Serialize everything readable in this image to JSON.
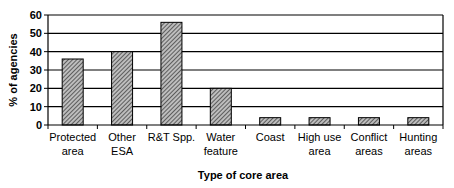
{
  "chart_data": {
    "type": "bar",
    "title": "",
    "xlabel": "Type of core area",
    "ylabel": "% of agencies",
    "categories": [
      [
        "Protected",
        "area"
      ],
      [
        "Other",
        "ESA"
      ],
      [
        "R&T Spp."
      ],
      [
        "Water",
        "feature"
      ],
      [
        "Coast"
      ],
      [
        "High use",
        "area"
      ],
      [
        "Conflict",
        "areas"
      ],
      [
        "Hunting",
        "areas"
      ]
    ],
    "values": [
      36,
      40,
      56,
      20,
      4,
      4,
      4,
      4
    ],
    "ylim": [
      0,
      60
    ],
    "yticks": [
      0,
      10,
      20,
      30,
      40,
      50,
      60
    ],
    "grid": true,
    "legend": "none",
    "bar_fill": "hatched-gray"
  }
}
